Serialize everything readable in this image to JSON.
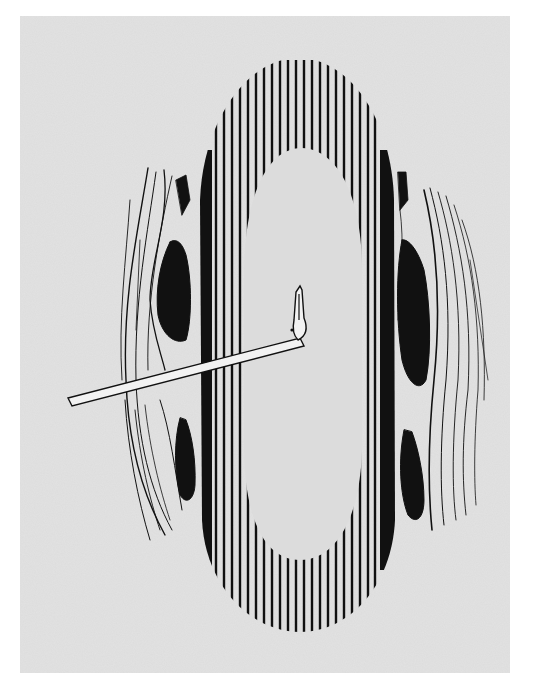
{
  "figure": {
    "colors": {
      "page_background": "#ffffff",
      "panel_background": "#dcdcdc",
      "ink": "#111111",
      "instrument_fill": "#f2f2f2"
    },
    "elements": [
      {
        "name": "incision-oval",
        "label": "Central incision with vertical hatching"
      },
      {
        "name": "left-tissue-edge",
        "label": "Left retracted tissue edge"
      },
      {
        "name": "right-tissue-edge",
        "label": "Right retracted tissue edge"
      },
      {
        "name": "hook-instrument",
        "label": "Right-angled hook probe"
      }
    ]
  }
}
